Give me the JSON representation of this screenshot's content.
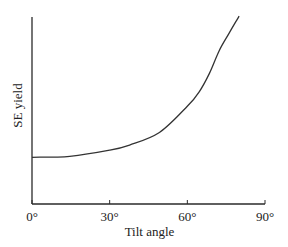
{
  "chart_data": {
    "type": "line",
    "title": "",
    "xlabel": "Tilt angle",
    "ylabel": "SE yield",
    "x_tick_labels": [
      "0°",
      "30°",
      "60°",
      "90°"
    ],
    "x_ticks": [
      0,
      30,
      60,
      90
    ],
    "xlim": [
      0,
      90
    ],
    "ylim": [
      0,
      4.0
    ],
    "y_units": "relative (value at 0° = 1)",
    "grid": false,
    "legend": "none",
    "series": [
      {
        "name": "SE yield",
        "x": [
          0,
          14.6,
          30,
          37.7,
          49.2,
          60,
          64.6,
          68.5,
          72.3,
          76.2,
          80
        ],
        "y": [
          1.0,
          1.02,
          1.15,
          1.26,
          1.53,
          2.09,
          2.4,
          2.79,
          3.28,
          3.66,
          4.02
        ]
      }
    ]
  }
}
